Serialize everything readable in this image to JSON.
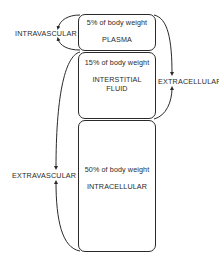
{
  "diagram": {
    "compartments": [
      {
        "id": "plasma",
        "percent_label": "5% of body weight",
        "name_lines": [
          "PLASMA"
        ]
      },
      {
        "id": "interstitial",
        "percent_label": "15% of body weight",
        "name_lines": [
          "INTERSTITIAL",
          "FLUID"
        ]
      },
      {
        "id": "intracellular",
        "percent_label": "50% of body weight",
        "name_lines": [
          "INTRACELLULAR"
        ]
      }
    ],
    "groupings": {
      "intravascular": "INTRAVASCULAR",
      "extracellular": "EXTRACELLULAR",
      "extravascular": "EXTRAVASCULAR"
    }
  }
}
